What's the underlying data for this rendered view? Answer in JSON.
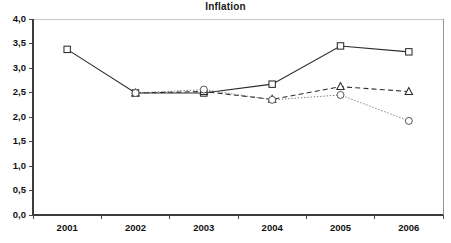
{
  "chart_data": {
    "type": "line",
    "title": "Inflation",
    "xlabel": "",
    "ylabel": "",
    "categories": [
      "2001",
      "2002",
      "2003",
      "2004",
      "2005",
      "2006"
    ],
    "ylim": [
      0.0,
      4.0
    ],
    "ytick_labels": [
      "0,0",
      "0,5",
      "1,0",
      "1,5",
      "2,0",
      "2,5",
      "3,0",
      "3,5",
      "4,0"
    ],
    "ytick_values": [
      0.0,
      0.5,
      1.0,
      1.5,
      2.0,
      2.5,
      3.0,
      3.5,
      4.0
    ],
    "grid": false,
    "legend": "none",
    "decimal_separator": ",",
    "series": [
      {
        "name": "series-square-solid",
        "marker": "square",
        "line_style": "solid",
        "color": "#2b2b2b",
        "x": [
          "2001",
          "2002",
          "2003",
          "2004",
          "2005",
          "2006"
        ],
        "values": [
          3.38,
          2.49,
          2.49,
          2.67,
          3.45,
          3.33
        ]
      },
      {
        "name": "series-triangle-dashed",
        "marker": "triangle",
        "line_style": "dashed",
        "color": "#2b2b2b",
        "x": [
          "2002",
          "2003",
          "2004",
          "2005",
          "2006"
        ],
        "values": [
          2.49,
          2.52,
          2.36,
          2.62,
          2.52
        ]
      },
      {
        "name": "series-circle-dotted",
        "marker": "circle",
        "line_style": "dotted",
        "color": "#6f6f6f",
        "x": [
          "2002",
          "2003",
          "2004",
          "2005",
          "2006"
        ],
        "values": [
          2.49,
          2.56,
          2.35,
          2.45,
          1.92
        ]
      }
    ]
  }
}
